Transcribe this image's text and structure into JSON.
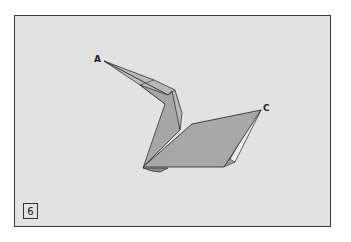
{
  "diagram": {
    "type": "origami-step",
    "step_number": "6",
    "labels": {
      "a": "A",
      "c": "C"
    },
    "colors": {
      "background": "#e2e2e2",
      "paper_fill": "#a8a8a8",
      "paper_light": "#bdbdbd",
      "line": "#333333",
      "frame": "#3a3a3a"
    }
  }
}
